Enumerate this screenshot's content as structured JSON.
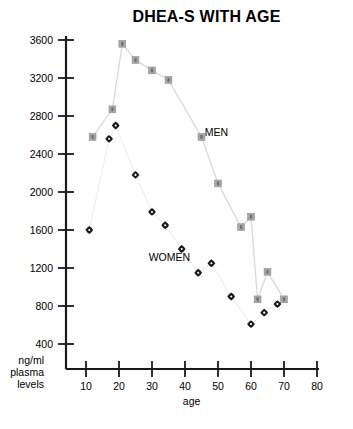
{
  "chart_data": {
    "type": "line",
    "title": "DHEA-S WITH AGE",
    "xlabel": "age",
    "ylabel": "ng/ml plasma levels",
    "ylabel_lines": [
      "ng/ml",
      "plasma",
      "levels"
    ],
    "xlim": [
      5,
      80
    ],
    "ylim": [
      0,
      3600
    ],
    "grid": false,
    "legend_position": "inline-annotation",
    "x_ticks": [
      10,
      20,
      30,
      40,
      50,
      60,
      70,
      80
    ],
    "y_ticks": [
      400,
      800,
      1200,
      1600,
      2000,
      2400,
      2800,
      3200,
      3600
    ],
    "series": [
      {
        "name": "MEN",
        "marker": "square",
        "marker_color": "#a8a8a8",
        "line_color": "#d9d9d9",
        "points": [
          {
            "x": 12,
            "y": 2580
          },
          {
            "x": 18,
            "y": 2870
          },
          {
            "x": 21,
            "y": 3560
          },
          {
            "x": 25,
            "y": 3390
          },
          {
            "x": 30,
            "y": 3280
          },
          {
            "x": 35,
            "y": 3180
          },
          {
            "x": 45,
            "y": 2580
          },
          {
            "x": 50,
            "y": 2090
          },
          {
            "x": 57,
            "y": 1630
          },
          {
            "x": 60,
            "y": 1740
          },
          {
            "x": 62,
            "y": 870
          },
          {
            "x": 65,
            "y": 1160
          },
          {
            "x": 70,
            "y": 870
          }
        ]
      },
      {
        "name": "WOMEN",
        "marker": "diamond",
        "marker_color": "#1a1a1a",
        "line_color": "#f0f0f0",
        "points": [
          {
            "x": 11,
            "y": 1600
          },
          {
            "x": 17,
            "y": 2560
          },
          {
            "x": 19,
            "y": 2700
          },
          {
            "x": 25,
            "y": 2180
          },
          {
            "x": 30,
            "y": 1790
          },
          {
            "x": 34,
            "y": 1650
          },
          {
            "x": 39,
            "y": 1400
          },
          {
            "x": 44,
            "y": 1150
          },
          {
            "x": 48,
            "y": 1250
          },
          {
            "x": 54,
            "y": 900
          },
          {
            "x": 60,
            "y": 610
          },
          {
            "x": 64,
            "y": 730
          },
          {
            "x": 68,
            "y": 820
          }
        ]
      }
    ],
    "annotations": [
      {
        "text": "MEN",
        "x": 46,
        "y": 2590
      },
      {
        "text": "WOMEN",
        "x": 29,
        "y": 1270
      }
    ]
  }
}
